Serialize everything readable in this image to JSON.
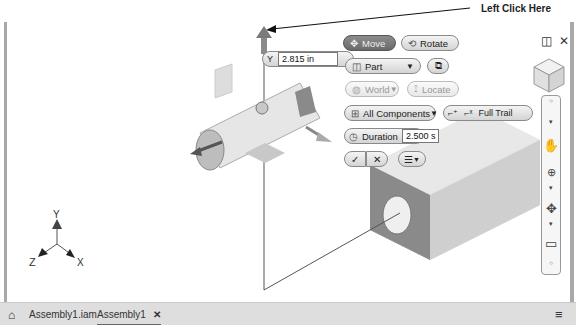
{
  "callout": {
    "text": "Left Click Here"
  },
  "window_controls": {
    "restore_icon": "panel-icon",
    "close_label": "✕"
  },
  "minitoolbar": {
    "coord_axis": "Y",
    "coord_value": "2.815 in",
    "move_label": "Move",
    "rotate_label": "Rotate",
    "part_label": "Part",
    "world_label": "World",
    "locate_label": "Locate",
    "components_label": "All Components",
    "trail_label": "Full Trail",
    "duration_label": "Duration",
    "duration_value": "2.500 s",
    "ok_label": "✓",
    "cancel_label": "✕"
  },
  "triad": {
    "y": "Y",
    "z": "Z",
    "x": "X"
  },
  "viewcube": {
    "faces": [
      "TOP",
      "FRONT",
      "RIGHT"
    ]
  },
  "navbar": {
    "items": [
      "full-navigation-wheel",
      "pan",
      "zoom",
      "orbit",
      "look-at"
    ]
  },
  "tabs": {
    "home_icon": "home-icon",
    "items": [
      {
        "label": "Assembly1.iam",
        "active": false
      },
      {
        "label": "Assembly1",
        "active": true,
        "close": "✕"
      }
    ],
    "menu_icon": "hamburger-icon"
  }
}
